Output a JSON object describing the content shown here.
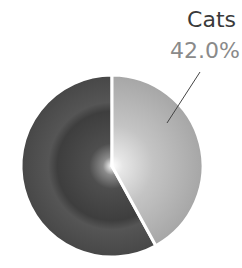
{
  "chart_data": {
    "type": "pie",
    "title": "",
    "categories": [
      "Cats",
      "Other"
    ],
    "values": [
      42.0,
      58.0
    ],
    "labels_shown": [
      {
        "name": "Cats",
        "percent": "42.0%"
      }
    ],
    "start_angle_deg": 0,
    "direction": "clockwise",
    "legend": "none",
    "colors": {
      "Cats": "#b8b8b8",
      "Other": "#4a4a4a",
      "separator": "#ffffff",
      "label_name": "#3a3a3a",
      "label_percent": "#8a8a8a",
      "leader_line": "#444444"
    }
  },
  "labels": {
    "cats_name": "Cats",
    "cats_percent": "42.0%"
  }
}
